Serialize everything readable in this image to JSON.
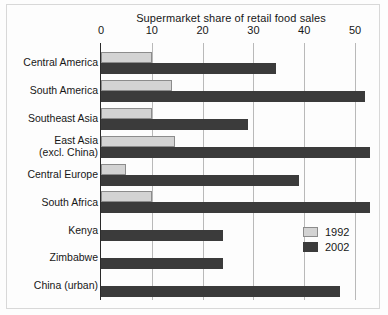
{
  "chart_data": {
    "type": "bar",
    "orientation": "horizontal",
    "title": "Supermarket share of retail food sales",
    "xlabel": "",
    "ylabel": "",
    "xlim": [
      0,
      55
    ],
    "xticks": [
      0,
      10,
      20,
      30,
      40,
      50
    ],
    "grid": true,
    "legend_position": "inside-bottom-right",
    "categories": [
      "Central America",
      "South America",
      "Southeast Asia",
      "East Asia\n(excl. China)",
      "Central Europe",
      "South Africa",
      "Kenya",
      "Zimbabwe",
      "China (urban)"
    ],
    "series": [
      {
        "name": "1992",
        "color": "#d3d3d3",
        "values": [
          10,
          14,
          10,
          14.5,
          5,
          10,
          0,
          0,
          0
        ]
      },
      {
        "name": "2002",
        "color": "#3b3b3b",
        "values": [
          34.5,
          52,
          29,
          53,
          39,
          53,
          24,
          24,
          47
        ]
      }
    ]
  },
  "legend": {
    "items": [
      {
        "label": "1992",
        "swatch": "y1992"
      },
      {
        "label": "2002",
        "swatch": "y2002"
      }
    ]
  }
}
